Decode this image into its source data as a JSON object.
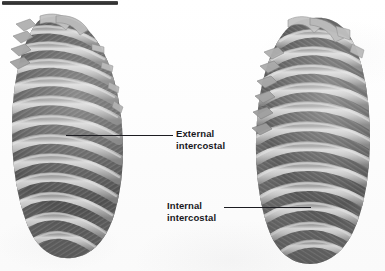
{
  "figure": {
    "background_color": "#fdfdfd",
    "width": 385,
    "height": 271,
    "top_rule": {
      "color": "#3a3a3a",
      "x": 2,
      "y": 1,
      "width": 116,
      "height": 4
    }
  },
  "labels": [
    {
      "id": "external-intercostal",
      "line1": "External",
      "line2": "intercostal",
      "text_x": 176,
      "text_y": 128,
      "leader": {
        "x1": 66,
        "y1": 135,
        "x2": 173,
        "y2": 135
      },
      "points_to": "left-rib-cage"
    },
    {
      "id": "internal-intercostal",
      "line1": "Internal",
      "line2": "intercostal",
      "text_x": 167,
      "text_y": 200,
      "leader": {
        "x1": 224,
        "y1": 207,
        "x2": 311,
        "y2": 207
      },
      "points_to": "right-rib-cage"
    }
  ],
  "diagram": {
    "type": "anatomical-illustration",
    "views": [
      {
        "id": "left-rib-cage",
        "name": "Left rib cage showing external intercostal muscles",
        "bbox": {
          "x": 8,
          "y": 16,
          "width": 117,
          "height": 244
        },
        "muscle": "External intercostal",
        "fiber_direction": "down-and-forward (sloping down to the right)",
        "rib_count": 12,
        "colors": {
          "rib": "#b9b9b9",
          "rib_shadow": "#8d8d8d",
          "muscle": "#5e5e5e",
          "muscle_dark": "#464646",
          "highlight": "#d8d8d8"
        }
      },
      {
        "id": "right-rib-cage",
        "name": "Right rib cage showing internal intercostal muscles",
        "bbox": {
          "x": 250,
          "y": 16,
          "width": 122,
          "height": 250
        },
        "muscle": "Internal intercostal",
        "fiber_direction": "down-and-backward (sloping down to the left)",
        "rib_count": 12,
        "colors": {
          "rib": "#bcbcbc",
          "rib_shadow": "#909090",
          "muscle": "#646464",
          "muscle_dark": "#4a4a4a",
          "highlight": "#dadada"
        }
      }
    ]
  }
}
